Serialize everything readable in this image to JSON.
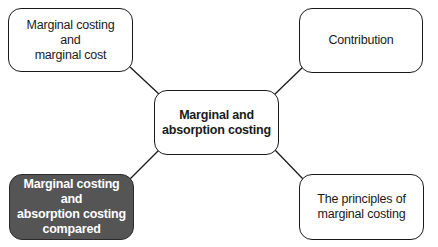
{
  "diagram": {
    "type": "mind-map",
    "center": {
      "label": "Marginal and\nabsorption costing"
    },
    "nodes": [
      {
        "id": "top-left",
        "label": "Marginal costing and\nmarginal cost",
        "highlighted": false
      },
      {
        "id": "top-right",
        "label": "Contribution",
        "highlighted": false
      },
      {
        "id": "bottom-left",
        "label": "Marginal costing and\nabsorption costing\ncompared",
        "highlighted": true
      },
      {
        "id": "bottom-right",
        "label": "The principles of\nmarginal costing",
        "highlighted": false
      }
    ],
    "edges": [
      {
        "from": "center",
        "to": "top-left"
      },
      {
        "from": "center",
        "to": "top-right"
      },
      {
        "from": "center",
        "to": "bottom-left"
      },
      {
        "from": "center",
        "to": "bottom-right"
      }
    ],
    "colors": {
      "border": "#1a1a1a",
      "node_fill": "#ffffff",
      "highlight_fill": "#555555",
      "highlight_text": "#ffffff"
    }
  }
}
